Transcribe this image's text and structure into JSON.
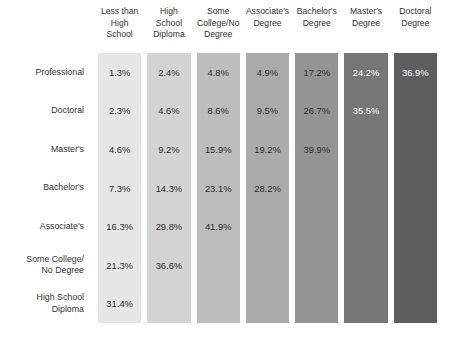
{
  "chart_data": {
    "type": "heatmap",
    "title": "",
    "subtitle": "",
    "xlabel": "",
    "ylabel": "",
    "grid": false,
    "legend_position": "none",
    "orientation": "staircase-lower-left",
    "categories": [
      "Less than\nHigh\nSchool",
      "High\nSchool\nDiploma",
      "Some\nCollege/No\nDegree",
      "Associate's\nDegree",
      "Bachelor's\nDegree",
      "Master's\nDegree",
      "Doctoral\nDegree"
    ],
    "rows": [
      "Professional",
      "Doctoral",
      "Master's",
      "Bachelor's",
      "Associate's",
      "Some College/\nNo Degree",
      "High School\nDiploma"
    ],
    "values": [
      [
        "1.3%",
        "2.4%",
        "4.8%",
        "4.9%",
        "17.2%",
        "24.2%",
        "36.9%"
      ],
      [
        "2.3%",
        "4.6%",
        "8.6%",
        "9.5%",
        "26.7%",
        "35.5%",
        ""
      ],
      [
        "4.6%",
        "9.2%",
        "15.9%",
        "19.2%",
        "39.9%",
        "",
        ""
      ],
      [
        "7.3%",
        "14.3%",
        "23.1%",
        "28.2%",
        "",
        "",
        ""
      ],
      [
        "16.3%",
        "29.8%",
        "41.9%",
        "",
        "",
        "",
        ""
      ],
      [
        "21.3%",
        "36.6%",
        "",
        "",
        "",
        "",
        ""
      ],
      [
        "31.4%",
        "",
        "",
        "",
        "",
        "",
        ""
      ]
    ],
    "numeric_values": [
      [
        1.3,
        2.4,
        4.8,
        4.9,
        17.2,
        24.2,
        36.9
      ],
      [
        2.3,
        4.6,
        8.6,
        9.5,
        26.7,
        35.5,
        null
      ],
      [
        4.6,
        9.2,
        15.9,
        19.2,
        39.9,
        null,
        null
      ],
      [
        7.3,
        14.3,
        23.1,
        28.2,
        null,
        null,
        null
      ],
      [
        16.3,
        29.8,
        41.9,
        null,
        null,
        null,
        null
      ],
      [
        21.3,
        36.6,
        null,
        null,
        null,
        null,
        null
      ],
      [
        31.4,
        null,
        null,
        null,
        null,
        null,
        null
      ]
    ],
    "column_colors": [
      "#e6e6e6",
      "#d3d3d3",
      "#bdbdbd",
      "#ababab",
      "#949494",
      "#767676",
      "#5e5e5e"
    ],
    "column_text_colors": [
      "#2b2b2b",
      "#2b2b2b",
      "#2b2b2b",
      "#2b2b2b",
      "#2b2b2b",
      "#ffffff",
      "#ffffff"
    ],
    "background_color": "#ffffff",
    "label_color": "#333333"
  }
}
